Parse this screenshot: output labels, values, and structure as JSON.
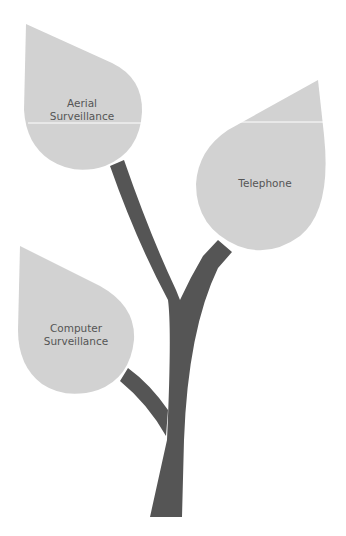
{
  "diagram": {
    "type": "tree-with-leaves",
    "colors": {
      "background": "#ffffff",
      "leaf": "#d2d2d2",
      "trunk": "#555555",
      "text": "#555555",
      "separator": "#ffffff"
    },
    "leaves": [
      {
        "id": "aerial",
        "line1": "Aerial",
        "line2": "Surveillance"
      },
      {
        "id": "telephone",
        "line1": "Telephone",
        "line2": ""
      },
      {
        "id": "computer",
        "line1": "Computer",
        "line2": "Surveillance"
      }
    ]
  }
}
